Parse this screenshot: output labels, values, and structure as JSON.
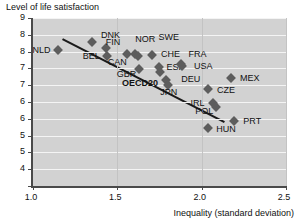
{
  "chart_data": {
    "type": "scatter",
    "title": "",
    "ylabel": "Level of life satisfaction",
    "xlabel": "Inequality (standard deviation)",
    "xlim": [
      1.0,
      2.5
    ],
    "ylim": [
      4,
      9
    ],
    "xticks": [
      1.0,
      1.5,
      2.0,
      2.5
    ],
    "xticklabels": [
      "1.0",
      "1.5",
      "2.0",
      "2.5"
    ],
    "yticks": [
      9,
      8.5,
      8,
      7.5,
      7,
      6.5,
      6,
      5.5,
      5,
      4.5,
      4
    ],
    "yticklabels": [
      "9",
      "8",
      "8",
      "7",
      "7",
      "6",
      "6",
      "5",
      "5",
      "4"
    ],
    "grid": "horizontal",
    "legend": "none",
    "points": [
      {
        "label": "NLD",
        "x": 1.15,
        "y": 8.05,
        "lx": 1.05,
        "ly": 8.05,
        "bold": false
      },
      {
        "label": "DNK",
        "x": 1.35,
        "y": 8.3,
        "lx": 1.46,
        "ly": 8.48,
        "bold": false
      },
      {
        "label": "FIN",
        "x": 1.43,
        "y": 8.1,
        "lx": 1.475,
        "ly": 8.28,
        "bold": false
      },
      {
        "label": "BEL",
        "x": 1.44,
        "y": 7.88,
        "lx": 1.345,
        "ly": 7.87,
        "bold": false
      },
      {
        "label": "CAN",
        "x": 1.555,
        "y": 7.92,
        "lx": 1.5,
        "ly": 7.7,
        "bold": false
      },
      {
        "label": "NOR",
        "x": 1.605,
        "y": 7.94,
        "lx": 1.665,
        "ly": 8.38,
        "bold": false
      },
      {
        "label": "SWE",
        "x": 1.625,
        "y": 7.86,
        "lx": 1.805,
        "ly": 8.42,
        "bold": false
      },
      {
        "label": "CHE",
        "x": 1.705,
        "y": 7.9,
        "lx": 1.815,
        "ly": 7.92,
        "bold": false
      },
      {
        "label": "GBR",
        "x": 1.63,
        "y": 7.47,
        "lx": 1.555,
        "ly": 7.33,
        "bold": false
      },
      {
        "label": "ESP",
        "x": 1.745,
        "y": 7.55,
        "lx": 1.845,
        "ly": 7.53,
        "bold": false
      },
      {
        "label": "FRA",
        "x": 1.875,
        "y": 7.62,
        "lx": 1.975,
        "ly": 7.93,
        "bold": false
      },
      {
        "label": "USA",
        "x": 1.885,
        "y": 7.58,
        "lx": 2.01,
        "ly": 7.58,
        "bold": false
      },
      {
        "label": "OECD20",
        "x": 1.755,
        "y": 7.4,
        "lx": 1.635,
        "ly": 7.08,
        "bold": true
      },
      {
        "label": "DEU",
        "x": 1.79,
        "y": 7.16,
        "lx": 1.935,
        "ly": 7.18,
        "bold": false
      },
      {
        "label": "JPN",
        "x": 1.8,
        "y": 7.02,
        "lx": 1.805,
        "ly": 6.8,
        "bold": false
      },
      {
        "label": "MEX",
        "x": 2.175,
        "y": 7.22,
        "lx": 2.285,
        "ly": 7.22,
        "bold": false
      },
      {
        "label": "CZE",
        "x": 2.04,
        "y": 6.88,
        "lx": 2.145,
        "ly": 6.86,
        "bold": false
      },
      {
        "label": "IRL",
        "x": 2.065,
        "y": 6.47,
        "lx": 1.975,
        "ly": 6.46,
        "bold": false
      },
      {
        "label": "POL",
        "x": 2.085,
        "y": 6.36,
        "lx": 2.015,
        "ly": 6.23,
        "bold": false
      },
      {
        "label": "PRT",
        "x": 2.19,
        "y": 5.92,
        "lx": 2.3,
        "ly": 5.92,
        "bold": false
      },
      {
        "label": "HUN",
        "x": 2.04,
        "y": 5.73,
        "lx": 2.145,
        "ly": 5.7,
        "bold": false
      }
    ],
    "trendline": {
      "x0": 1.175,
      "y0": 8.37,
      "x1": 2.135,
      "y1": 5.9
    }
  },
  "colors": {
    "plot_background": "#d2d2d2",
    "gridline": "#f4f4f4",
    "marker": "#5d5d5d",
    "axis": "#4a4a4a",
    "trendline": "#1a1a1a",
    "text": "#111111"
  }
}
